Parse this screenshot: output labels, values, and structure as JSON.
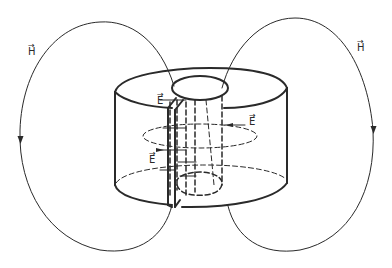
{
  "diagram": {
    "labels": {
      "h_left": "H",
      "h_right": "H",
      "e_top": "E",
      "e_right": "E",
      "e_middle": "E",
      "vector_arrow": "→"
    },
    "colors": {
      "ink": "#2a2a2a",
      "background": "#ffffff"
    }
  }
}
